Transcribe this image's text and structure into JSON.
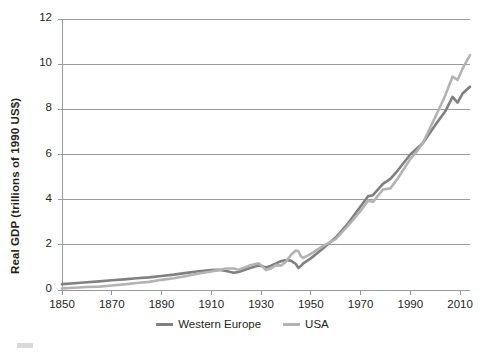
{
  "chart_data": {
    "type": "line",
    "title": "",
    "xlabel": "",
    "ylabel": "Real GDP (trillions of 1990 US$)",
    "xlim": [
      1850,
      2014
    ],
    "ylim": [
      0,
      12
    ],
    "grid": true,
    "legend_position": "bottom",
    "xticks": [
      "1850",
      "1870",
      "1890",
      "1910",
      "1930",
      "1950",
      "1970",
      "1990",
      "2010"
    ],
    "xtick_values": [
      1850,
      1870,
      1890,
      1910,
      1930,
      1950,
      1970,
      1990,
      2010
    ],
    "yticks": [
      "0",
      "2",
      "4",
      "6",
      "8",
      "10",
      "12"
    ],
    "ytick_values": [
      0,
      2,
      4,
      6,
      8,
      10,
      12
    ],
    "x": [
      1850,
      1855,
      1860,
      1865,
      1870,
      1875,
      1880,
      1885,
      1890,
      1895,
      1900,
      1905,
      1910,
      1913,
      1916,
      1919,
      1921,
      1925,
      1929,
      1930,
      1932,
      1934,
      1936,
      1938,
      1940,
      1942,
      1944,
      1945,
      1946,
      1947,
      1950,
      1955,
      1960,
      1965,
      1970,
      1973,
      1975,
      1979,
      1982,
      1985,
      1990,
      1992,
      1995,
      2000,
      2004,
      2007,
      2009,
      2011,
      2014
    ],
    "series": [
      {
        "name": "Western Europe",
        "color": "#808080",
        "values": [
          0.26,
          0.3,
          0.34,
          0.38,
          0.43,
          0.47,
          0.52,
          0.56,
          0.62,
          0.68,
          0.76,
          0.83,
          0.88,
          0.9,
          0.84,
          0.76,
          0.8,
          0.95,
          1.08,
          1.07,
          1.0,
          1.08,
          1.18,
          1.27,
          1.33,
          1.3,
          1.15,
          0.98,
          1.06,
          1.18,
          1.4,
          1.85,
          2.32,
          2.95,
          3.7,
          4.15,
          4.2,
          4.7,
          4.92,
          5.3,
          6.0,
          6.2,
          6.5,
          7.3,
          7.9,
          8.55,
          8.3,
          8.7,
          9.0
        ]
      },
      {
        "name": "USA",
        "color": "#b3b3b3",
        "values": [
          0.07,
          0.1,
          0.13,
          0.15,
          0.2,
          0.25,
          0.31,
          0.36,
          0.45,
          0.52,
          0.62,
          0.73,
          0.82,
          0.88,
          0.95,
          0.95,
          0.9,
          1.07,
          1.18,
          1.1,
          0.88,
          0.95,
          1.1,
          1.08,
          1.25,
          1.55,
          1.75,
          1.72,
          1.5,
          1.42,
          1.6,
          1.95,
          2.25,
          2.85,
          3.5,
          3.95,
          3.9,
          4.45,
          4.5,
          4.95,
          5.8,
          6.05,
          6.5,
          7.65,
          8.6,
          9.45,
          9.3,
          9.8,
          10.4
        ]
      }
    ]
  },
  "legend": {
    "items": [
      {
        "label": "Western Europe",
        "color": "#808080"
      },
      {
        "label": "USA",
        "color": "#b3b3b3"
      }
    ]
  }
}
